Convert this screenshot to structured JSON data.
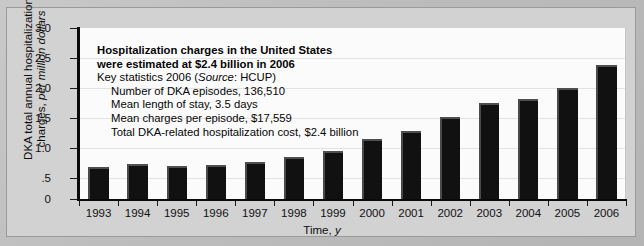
{
  "chart_data": {
    "type": "bar",
    "title": "",
    "xlabel": "Time, y",
    "ylabel": "DKA total annual hospitalization charges, per million dollars",
    "ylim": [
      0,
      3.0
    ],
    "yticks": [
      "0",
      ".5",
      "1.0",
      "1.5",
      "2.0",
      "2.5",
      "3.0"
    ],
    "ytick_values": [
      0,
      0.5,
      1.0,
      1.5,
      2.0,
      2.5,
      3.0
    ],
    "grid": true,
    "legend": "none",
    "categories": [
      "1993",
      "1994",
      "1995",
      "1996",
      "1997",
      "1998",
      "1999",
      "2000",
      "2001",
      "2002",
      "2003",
      "2004",
      "2005",
      "2006"
    ],
    "values": [
      0.57,
      0.62,
      0.58,
      0.59,
      0.65,
      0.74,
      0.85,
      1.06,
      1.19,
      1.43,
      1.68,
      1.76,
      1.95,
      2.35
    ],
    "bar_color": "#111111"
  },
  "annotation": {
    "headline_line1": "Hospitalization charges in the United States",
    "headline_line2": "were estimated at $2.4 billion in 2006",
    "key_stats_label": "Key statistics 2006 (",
    "key_stats_source_italic": "Source",
    "key_stats_source_rest": ": HCUP)",
    "items": [
      "Number of DKA episodes, 136,510",
      "Mean length of stay, 3.5 days",
      "Mean charges per episode, $17,559",
      "Total DKA-related hospitalization cost, $2.4 billion"
    ]
  },
  "axis_titles": {
    "y_line1": "DKA total annual hospitalization",
    "y_line2_plain": "charges, ",
    "y_line2_italic": "per million dollars",
    "x_plain": "Time, ",
    "x_italic": "y"
  }
}
